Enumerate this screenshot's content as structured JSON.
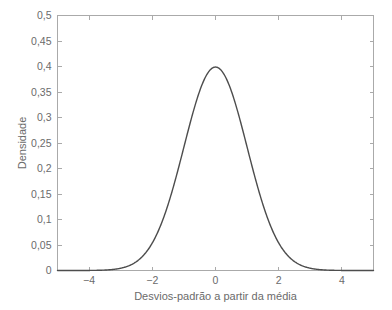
{
  "chart_data": {
    "type": "line",
    "title": "",
    "subtitle": "",
    "xlabel": "Desvios-padrão a partir da média",
    "ylabel": "Densidade",
    "xlim": [
      -5,
      5
    ],
    "ylim": [
      0,
      0.5
    ],
    "grid": false,
    "legend": null,
    "legend_position": "none",
    "annotations": [],
    "xticks": [
      -4,
      -2,
      0,
      2,
      4
    ],
    "xticklabels": [
      "−4",
      "−2",
      "0",
      "2",
      "4"
    ],
    "yticks": [
      0,
      0.05,
      0.1,
      0.15,
      0.2,
      0.25,
      0.3,
      0.35,
      0.4,
      0.45,
      0.5
    ],
    "yticklabels": [
      "0",
      "0,05",
      "0,1",
      "0,15",
      "0,2",
      "0,25",
      "0,3",
      "0,35",
      "0,4",
      "0,45",
      "0,5"
    ],
    "series": [
      {
        "name": "Distribuição normal padrão",
        "color": "#4d4d4d",
        "x": [
          -5.0,
          -4.8,
          -4.6,
          -4.4,
          -4.2,
          -4.0,
          -3.8,
          -3.6,
          -3.4,
          -3.2,
          -3.0,
          -2.8,
          -2.6,
          -2.4,
          -2.2,
          -2.0,
          -1.8,
          -1.6,
          -1.4,
          -1.2,
          -1.0,
          -0.8,
          -0.6,
          -0.4,
          -0.2,
          0.0,
          0.2,
          0.4,
          0.6,
          0.8,
          1.0,
          1.2,
          1.4,
          1.6,
          1.8,
          2.0,
          2.2,
          2.4,
          2.6,
          2.8,
          3.0,
          3.2,
          3.4,
          3.6,
          3.8,
          4.0,
          4.2,
          4.4,
          4.6,
          4.8,
          5.0
        ],
        "y": [
          0.0,
          0.0,
          0.0,
          0.0,
          0.0001,
          0.0001,
          0.0003,
          0.0006,
          0.0012,
          0.0024,
          0.0044,
          0.0079,
          0.0136,
          0.0224,
          0.0355,
          0.054,
          0.079,
          0.1109,
          0.1497,
          0.1942,
          0.242,
          0.2897,
          0.3332,
          0.3683,
          0.391,
          0.3989,
          0.391,
          0.3683,
          0.3332,
          0.2897,
          0.242,
          0.1942,
          0.1497,
          0.1109,
          0.079,
          0.054,
          0.0355,
          0.0224,
          0.0136,
          0.0079,
          0.0044,
          0.0024,
          0.0012,
          0.0006,
          0.0003,
          0.0001,
          0.0001,
          0.0,
          0.0,
          0.0,
          0.0
        ]
      }
    ],
    "peak": {
      "x": 0,
      "y": 0.3989
    }
  },
  "style": {
    "background_color": "#ffffff",
    "frame_color": "#aaaaaa",
    "text_color": "#6b6b6b",
    "curve_color": "#4d4d4d"
  }
}
